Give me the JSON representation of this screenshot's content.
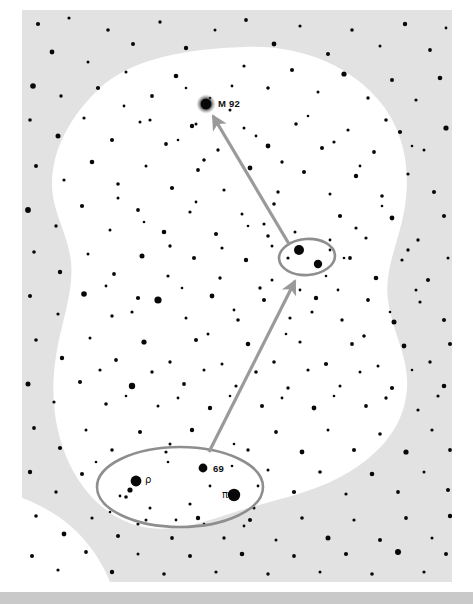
{
  "chart": {
    "type": "star-chart",
    "background_color": "#ffffff",
    "field_color": "#e2e2e2",
    "field_rect": {
      "x": 22,
      "y": 10,
      "width": 430,
      "height": 572
    },
    "blob_color": "#ffffff",
    "star_color": "#080808",
    "marker_color": "#8e8e8e",
    "arrow_color": "#9a9a9a",
    "footer_bar": {
      "x": 0,
      "y": 592,
      "width": 473,
      "height": 12,
      "color": "#c9c9c9"
    }
  },
  "labels": [
    {
      "id": "m92",
      "text": "M 92",
      "x": 218,
      "y": 107,
      "anchor": "start",
      "style": "latin"
    },
    {
      "id": "rho",
      "text": "ρ",
      "x": 145,
      "y": 483,
      "anchor": "start",
      "style": "greek"
    },
    {
      "id": "n69",
      "text": "69",
      "x": 213,
      "y": 472,
      "anchor": "start",
      "style": "latin"
    },
    {
      "id": "pi",
      "text": "π",
      "x": 222,
      "y": 498,
      "anchor": "start",
      "style": "greek"
    }
  ],
  "deep_sky_objects": [
    {
      "id": "m92",
      "name": "M 92",
      "x": 206,
      "y": 104,
      "radius": 5.2,
      "fuzzy": true
    }
  ],
  "markers": [
    {
      "id": "keystone-asterism-ellipse",
      "shape": "ellipse",
      "cx": 180,
      "cy": 487,
      "rx": 83,
      "ry": 40,
      "rotation": 0
    },
    {
      "id": "midway-pair-ellipse",
      "shape": "ellipse",
      "cx": 307,
      "cy": 257,
      "rx": 28,
      "ry": 18,
      "rotation": -4
    }
  ],
  "arrows": [
    {
      "id": "hop-arrow-lower",
      "x1": 209,
      "y1": 452,
      "x2": 295,
      "y2": 281
    },
    {
      "id": "hop-arrow-upper",
      "x1": 289,
      "y1": 244,
      "x2": 213,
      "y2": 116
    }
  ],
  "named_stars": [
    {
      "id": "rho-her",
      "label": "ρ",
      "x": 136,
      "y": 481,
      "radius": 5.4
    },
    {
      "id": "69-her",
      "label": "69",
      "x": 203,
      "y": 468,
      "radius": 4.4
    },
    {
      "id": "pi-her",
      "label": "π",
      "x": 234,
      "y": 495,
      "radius": 6.2
    },
    {
      "id": "pair-a",
      "label": "",
      "x": 299,
      "y": 250,
      "radius": 5.0
    },
    {
      "id": "pair-b",
      "label": "",
      "x": 318,
      "y": 264,
      "radius": 4.2
    }
  ],
  "stars": [
    [
      38,
      24,
      2.1
    ],
    [
      69,
      18,
      1.6
    ],
    [
      108,
      30,
      1.8
    ],
    [
      52,
      52,
      2.4
    ],
    [
      88,
      62,
      1.5
    ],
    [
      133,
      44,
      2.0
    ],
    [
      160,
      22,
      1.7
    ],
    [
      186,
      48,
      2.2
    ],
    [
      215,
      30,
      1.5
    ],
    [
      246,
      20,
      1.9
    ],
    [
      274,
      44,
      2.4
    ],
    [
      300,
      26,
      1.6
    ],
    [
      328,
      54,
      2.0
    ],
    [
      352,
      30,
      1.8
    ],
    [
      380,
      46,
      1.5
    ],
    [
      405,
      24,
      2.2
    ],
    [
      430,
      50,
      1.9
    ],
    [
      446,
      28,
      1.4
    ],
    [
      33,
      86,
      2.8
    ],
    [
      61,
      96,
      1.7
    ],
    [
      98,
      88,
      2.1
    ],
    [
      126,
      72,
      1.5
    ],
    [
      152,
      96,
      1.9
    ],
    [
      176,
      76,
      2.3
    ],
    [
      244,
      66,
      1.6
    ],
    [
      268,
      88,
      1.8
    ],
    [
      292,
      70,
      2.0
    ],
    [
      318,
      92,
      1.5
    ],
    [
      344,
      74,
      2.6
    ],
    [
      368,
      98,
      1.7
    ],
    [
      392,
      80,
      2.0
    ],
    [
      416,
      100,
      1.6
    ],
    [
      440,
      78,
      2.3
    ],
    [
      30,
      120,
      1.8
    ],
    [
      58,
      136,
      2.5
    ],
    [
      84,
      118,
      1.6
    ],
    [
      112,
      140,
      2.0
    ],
    [
      140,
      122,
      1.5
    ],
    [
      166,
      144,
      1.9
    ],
    [
      192,
      126,
      2.2
    ],
    [
      218,
      150,
      1.7
    ],
    [
      244,
      128,
      1.5
    ],
    [
      268,
      146,
      2.4
    ],
    [
      296,
      124,
      1.8
    ],
    [
      322,
      148,
      2.0
    ],
    [
      348,
      130,
      1.6
    ],
    [
      374,
      152,
      1.9
    ],
    [
      400,
      132,
      2.1
    ],
    [
      424,
      150,
      1.5
    ],
    [
      446,
      128,
      2.6
    ],
    [
      36,
      166,
      2.0
    ],
    [
      64,
      180,
      1.6
    ],
    [
      92,
      162,
      2.3
    ],
    [
      118,
      184,
      1.8
    ],
    [
      146,
      166,
      1.5
    ],
    [
      172,
      188,
      2.1
    ],
    [
      198,
      170,
      1.9
    ],
    [
      224,
      190,
      1.6
    ],
    [
      250,
      168,
      2.4
    ],
    [
      278,
      192,
      1.7
    ],
    [
      304,
      172,
      2.0
    ],
    [
      330,
      194,
      1.5
    ],
    [
      356,
      176,
      2.2
    ],
    [
      382,
      196,
      1.8
    ],
    [
      408,
      174,
      1.6
    ],
    [
      434,
      192,
      2.0
    ],
    [
      28,
      210,
      2.9
    ],
    [
      56,
      226,
      1.7
    ],
    [
      82,
      206,
      2.1
    ],
    [
      110,
      230,
      1.5
    ],
    [
      138,
      210,
      1.9
    ],
    [
      164,
      232,
      2.3
    ],
    [
      190,
      212,
      1.6
    ],
    [
      216,
      234,
      2.0
    ],
    [
      242,
      214,
      1.5
    ],
    [
      268,
      236,
      1.8
    ],
    [
      340,
      216,
      2.1
    ],
    [
      366,
      238,
      1.6
    ],
    [
      392,
      218,
      2.4
    ],
    [
      418,
      240,
      1.7
    ],
    [
      444,
      216,
      2.0
    ],
    [
      34,
      252,
      1.8
    ],
    [
      60,
      272,
      2.2
    ],
    [
      88,
      254,
      1.5
    ],
    [
      114,
      274,
      1.9
    ],
    [
      142,
      256,
      2.5
    ],
    [
      168,
      276,
      1.6
    ],
    [
      194,
      258,
      2.0
    ],
    [
      220,
      278,
      1.7
    ],
    [
      246,
      260,
      2.2
    ],
    [
      272,
      280,
      1.5
    ],
    [
      350,
      258,
      1.9
    ],
    [
      376,
      278,
      2.3
    ],
    [
      402,
      260,
      1.6
    ],
    [
      428,
      280,
      2.0
    ],
    [
      448,
      258,
      1.5
    ],
    [
      30,
      296,
      2.0
    ],
    [
      58,
      314,
      1.6
    ],
    [
      84,
      294,
      2.8
    ],
    [
      112,
      316,
      1.7
    ],
    [
      138,
      298,
      2.1
    ],
    [
      158,
      300,
      3.6
    ],
    [
      186,
      318,
      1.5
    ],
    [
      212,
      296,
      2.4
    ],
    [
      238,
      320,
      1.8
    ],
    [
      264,
      300,
      2.0
    ],
    [
      290,
      318,
      1.6
    ],
    [
      316,
      298,
      2.2
    ],
    [
      342,
      320,
      1.7
    ],
    [
      368,
      300,
      1.9
    ],
    [
      394,
      322,
      2.5
    ],
    [
      420,
      302,
      1.6
    ],
    [
      444,
      320,
      2.0
    ],
    [
      36,
      340,
      1.8
    ],
    [
      62,
      358,
      2.2
    ],
    [
      90,
      338,
      1.5
    ],
    [
      116,
      360,
      1.9
    ],
    [
      144,
      342,
      2.6
    ],
    [
      170,
      362,
      1.7
    ],
    [
      196,
      340,
      2.0
    ],
    [
      222,
      364,
      1.5
    ],
    [
      248,
      344,
      2.3
    ],
    [
      274,
      362,
      1.8
    ],
    [
      300,
      342,
      1.6
    ],
    [
      326,
      364,
      2.1
    ],
    [
      352,
      344,
      1.9
    ],
    [
      378,
      366,
      1.5
    ],
    [
      404,
      346,
      2.4
    ],
    [
      430,
      362,
      1.7
    ],
    [
      450,
      344,
      2.0
    ],
    [
      28,
      384,
      2.5
    ],
    [
      54,
      402,
      1.6
    ],
    [
      80,
      382,
      2.0
    ],
    [
      106,
      404,
      1.8
    ],
    [
      132,
      386,
      3.2
    ],
    [
      158,
      406,
      1.5
    ],
    [
      184,
      384,
      1.9
    ],
    [
      210,
      408,
      2.2
    ],
    [
      236,
      386,
      1.6
    ],
    [
      262,
      406,
      2.0
    ],
    [
      288,
      388,
      1.7
    ],
    [
      314,
      408,
      2.4
    ],
    [
      340,
      386,
      1.5
    ],
    [
      366,
      406,
      1.9
    ],
    [
      392,
      388,
      2.1
    ],
    [
      418,
      410,
      1.6
    ],
    [
      444,
      386,
      2.3
    ],
    [
      34,
      428,
      1.9
    ],
    [
      60,
      448,
      2.1
    ],
    [
      86,
      430,
      1.5
    ],
    [
      112,
      450,
      1.8
    ],
    [
      140,
      432,
      2.0
    ],
    [
      166,
      452,
      1.6
    ],
    [
      192,
      430,
      2.2
    ],
    [
      248,
      450,
      1.7
    ],
    [
      276,
      432,
      1.9
    ],
    [
      302,
      452,
      2.4
    ],
    [
      328,
      430,
      1.5
    ],
    [
      354,
      450,
      2.0
    ],
    [
      380,
      434,
      1.8
    ],
    [
      406,
      452,
      2.6
    ],
    [
      432,
      430,
      1.6
    ],
    [
      450,
      450,
      1.9
    ],
    [
      30,
      472,
      2.2
    ],
    [
      56,
      492,
      1.7
    ],
    [
      82,
      474,
      2.0
    ],
    [
      268,
      470,
      1.5
    ],
    [
      294,
      492,
      2.1
    ],
    [
      320,
      472,
      1.8
    ],
    [
      346,
      494,
      1.6
    ],
    [
      372,
      474,
      2.3
    ],
    [
      398,
      492,
      1.9
    ],
    [
      424,
      472,
      1.5
    ],
    [
      448,
      490,
      2.0
    ],
    [
      36,
      516,
      1.8
    ],
    [
      64,
      534,
      2.4
    ],
    [
      92,
      518,
      1.6
    ],
    [
      118,
      536,
      2.0
    ],
    [
      146,
      520,
      1.5
    ],
    [
      172,
      538,
      1.9
    ],
    [
      198,
      518,
      2.2
    ],
    [
      224,
      538,
      1.7
    ],
    [
      250,
      520,
      2.0
    ],
    [
      276,
      540,
      1.5
    ],
    [
      302,
      518,
      1.8
    ],
    [
      328,
      538,
      2.5
    ],
    [
      354,
      520,
      1.6
    ],
    [
      380,
      540,
      2.0
    ],
    [
      406,
      518,
      1.9
    ],
    [
      432,
      538,
      1.5
    ],
    [
      450,
      516,
      2.2
    ],
    [
      32,
      556,
      2.0
    ],
    [
      58,
      570,
      1.6
    ],
    [
      86,
      552,
      1.9
    ],
    [
      112,
      572,
      2.2
    ],
    [
      138,
      554,
      1.5
    ],
    [
      164,
      574,
      1.8
    ],
    [
      190,
      556,
      2.0
    ],
    [
      216,
      572,
      1.6
    ],
    [
      242,
      554,
      2.3
    ],
    [
      268,
      574,
      1.7
    ],
    [
      294,
      556,
      1.9
    ],
    [
      320,
      572,
      1.5
    ],
    [
      346,
      554,
      2.1
    ],
    [
      372,
      574,
      1.8
    ],
    [
      398,
      552,
      3.0
    ],
    [
      424,
      572,
      1.6
    ],
    [
      446,
      554,
      2.0
    ],
    [
      124,
      106,
      1.4
    ],
    [
      150,
      120,
      1.6
    ],
    [
      178,
      140,
      1.3
    ],
    [
      204,
      160,
      1.8
    ],
    [
      230,
      110,
      1.5
    ],
    [
      256,
      136,
      1.4
    ],
    [
      282,
      162,
      1.7
    ],
    [
      308,
      116,
      1.3
    ],
    [
      334,
      142,
      1.6
    ],
    [
      360,
      166,
      1.4
    ],
    [
      386,
      120,
      1.8
    ],
    [
      412,
      146,
      1.3
    ],
    [
      118,
      198,
      1.5
    ],
    [
      144,
      222,
      1.3
    ],
    [
      170,
      246,
      1.7
    ],
    [
      196,
      202,
      1.4
    ],
    [
      222,
      248,
      1.6
    ],
    [
      248,
      226,
      1.3
    ],
    [
      274,
      204,
      1.8
    ],
    [
      330,
      250,
      1.4
    ],
    [
      356,
      228,
      1.6
    ],
    [
      382,
      206,
      1.3
    ],
    [
      408,
      250,
      1.7
    ],
    [
      106,
      286,
      1.4
    ],
    [
      132,
      312,
      1.6
    ],
    [
      182,
      288,
      1.3
    ],
    [
      208,
      334,
      1.5
    ],
    [
      234,
      310,
      1.4
    ],
    [
      260,
      288,
      1.7
    ],
    [
      286,
      334,
      1.3
    ],
    [
      312,
      312,
      1.6
    ],
    [
      338,
      290,
      1.4
    ],
    [
      364,
      336,
      1.8
    ],
    [
      390,
      312,
      1.3
    ],
    [
      416,
      290,
      1.5
    ],
    [
      100,
      370,
      1.6
    ],
    [
      126,
      396,
      1.3
    ],
    [
      152,
      372,
      1.7
    ],
    [
      178,
      398,
      1.4
    ],
    [
      204,
      370,
      1.5
    ],
    [
      230,
      396,
      1.3
    ],
    [
      256,
      372,
      1.8
    ],
    [
      282,
      398,
      1.4
    ],
    [
      308,
      370,
      1.6
    ],
    [
      334,
      396,
      1.3
    ],
    [
      360,
      372,
      1.5
    ],
    [
      386,
      398,
      1.7
    ],
    [
      412,
      370,
      1.3
    ],
    [
      438,
      396,
      1.6
    ],
    [
      96,
      462,
      1.3
    ],
    [
      120,
      496,
      1.4
    ],
    [
      150,
      508,
      1.5
    ],
    [
      168,
      462,
      1.3
    ],
    [
      190,
      504,
      1.6
    ],
    [
      210,
      486,
      1.4
    ],
    [
      232,
      466,
      1.3
    ],
    [
      254,
      508,
      1.5
    ],
    [
      176,
      520,
      1.4
    ],
    [
      204,
      524,
      1.3
    ],
    [
      138,
      524,
      1.6
    ],
    [
      244,
      526,
      1.4
    ],
    [
      130,
      490,
      2.6
    ],
    [
      126,
      497,
      1.8
    ],
    [
      258,
      486,
      1.4
    ],
    [
      110,
      512,
      1.3
    ],
    [
      170,
      444,
      1.5
    ],
    [
      234,
      444,
      1.3
    ],
    [
      295,
      232,
      1.5
    ],
    [
      288,
      258,
      1.6
    ],
    [
      330,
      240,
      1.4
    ],
    [
      326,
      276,
      1.3
    ],
    [
      272,
      246,
      1.5
    ],
    [
      344,
      258,
      1.3
    ],
    [
      264,
      224,
      1.6
    ],
    [
      300,
      290,
      1.4
    ],
    [
      210,
      98,
      1.3
    ],
    [
      196,
      124,
      1.5
    ],
    [
      232,
      86,
      1.4
    ],
    [
      186,
      88,
      1.3
    ]
  ]
}
